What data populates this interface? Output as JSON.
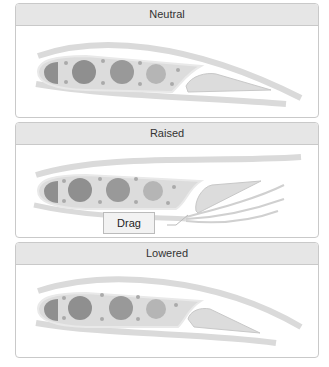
{
  "panels": [
    {
      "title": "Neutral",
      "state": "neutral"
    },
    {
      "title": "Raised",
      "state": "raised",
      "callout": "Drag"
    },
    {
      "title": "Lowered",
      "state": "lowered"
    }
  ],
  "colors": {
    "header_bg": "#e6e6e6",
    "border": "#c9c9c9",
    "airfoil_fill": "#dcdcdc",
    "spar_dark": "#8f8f8f",
    "spar_mid": "#a3a3a3",
    "spar_light": "#bdbdbd",
    "airflow": "#d6d6d6"
  }
}
